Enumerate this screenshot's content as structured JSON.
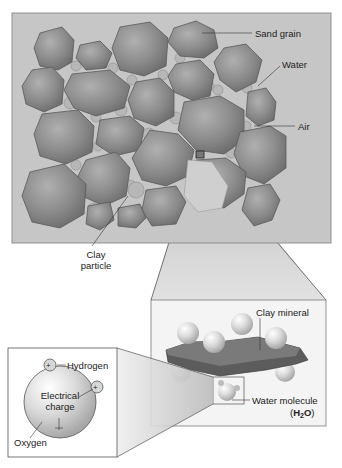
{
  "diagram": {
    "colors": {
      "panel_bg": "#c6c6c6",
      "panel_border": "#8f8f8f",
      "grain_fill": "#8c8c8c",
      "grain_stroke": "#5a5a5a",
      "water_fill": "#b5b5b5",
      "clay_mineral": "#555555",
      "molecule_fill": "#d8d8d8",
      "zoom_cone": "#bdbdbd"
    },
    "soil_panel": {
      "labels": {
        "sand_grain": "Sand grain",
        "water": "Water",
        "air": "Air",
        "clay_particle_line1": "Clay",
        "clay_particle_line2": "particle"
      }
    },
    "clay_inset": {
      "labels": {
        "clay_mineral": "Clay mineral",
        "water_molecule": "Water molecule",
        "formula_open": "(",
        "formula_h": "H",
        "formula_sub": "2",
        "formula_o": "O",
        "formula_close": ")"
      }
    },
    "water_inset": {
      "labels": {
        "hydrogen": "Hydrogen",
        "electrical_line1": "Electrical",
        "electrical_line2": "charge",
        "oxygen": "Oxygen",
        "plus": "+",
        "minus": "−"
      }
    }
  }
}
